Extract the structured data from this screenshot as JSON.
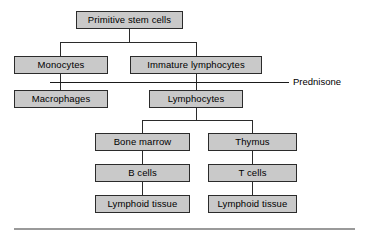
{
  "diagram": {
    "colors": {
      "node_fill": "#c9c9c9",
      "node_border": "#2b2b2b",
      "connector": "#2b2b2b",
      "drug_line": "#1a1a1a",
      "footer_rule": "#9a9a9a",
      "background": "#ffffff",
      "text": "#000000"
    },
    "nodes": [
      {
        "id": "primitive_stem_cells",
        "label": "Primitive stem cells"
      },
      {
        "id": "monocytes",
        "label": "Monocytes"
      },
      {
        "id": "immature_lymphocytes",
        "label": "Immature lymphocytes"
      },
      {
        "id": "macrophages",
        "label": "Macrophages"
      },
      {
        "id": "lymphocytes",
        "label": "Lymphocytes"
      },
      {
        "id": "bone_marrow",
        "label": "Bone marrow"
      },
      {
        "id": "thymus",
        "label": "Thymus"
      },
      {
        "id": "b_cells",
        "label": "B cells"
      },
      {
        "id": "t_cells",
        "label": "T cells"
      },
      {
        "id": "lymphoid_tissue_b",
        "label": "Lymphoid tissue"
      },
      {
        "id": "lymphoid_tissue_t",
        "label": "Lymphoid tissue"
      }
    ],
    "annotations": [
      {
        "id": "prednisone",
        "label": "Prednisone"
      }
    ]
  }
}
